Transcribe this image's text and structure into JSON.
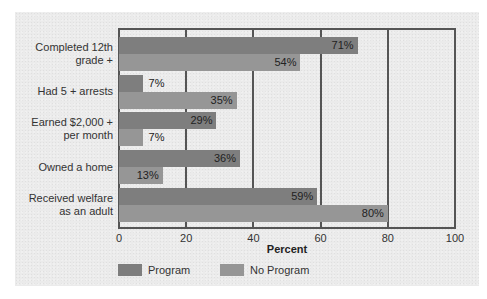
{
  "chart_data": {
    "type": "bar",
    "orientation": "horizontal",
    "title": "",
    "xlabel": "Percent",
    "ylabel": "",
    "xlim": [
      0,
      100
    ],
    "xticks": [
      "0",
      "20",
      "40",
      "60",
      "80",
      "100"
    ],
    "grid": true,
    "legend_position": "bottom",
    "categories": [
      "Completed 12th grade +",
      "Had 5 + arrests",
      "Earned $2,000 + per month",
      "Owned a home",
      "Received welfare as an adult"
    ],
    "series": [
      {
        "name": "Program",
        "color": "#7e7e7e",
        "values": [
          71,
          7,
          29,
          36,
          59
        ]
      },
      {
        "name": "No Program",
        "color": "#969696",
        "values": [
          54,
          35,
          7,
          13,
          80
        ]
      }
    ]
  },
  "labels": {
    "categories": [
      [
        "Completed 12th",
        "grade +"
      ],
      [
        "Had 5 + arrests"
      ],
      [
        "Earned $2,000 +",
        "per month"
      ],
      [
        "Owned a home"
      ],
      [
        "Received welfare",
        "as an adult"
      ]
    ],
    "values": {
      "program": [
        "71%",
        "7%",
        "29%",
        "36%",
        "59%"
      ],
      "noprogram": [
        "54%",
        "35%",
        "7%",
        "13%",
        "80%"
      ]
    },
    "xticks": [
      "0",
      "20",
      "40",
      "60",
      "80",
      "100"
    ],
    "xlabel": "Percent",
    "legend": [
      "Program",
      "No Program"
    ]
  }
}
